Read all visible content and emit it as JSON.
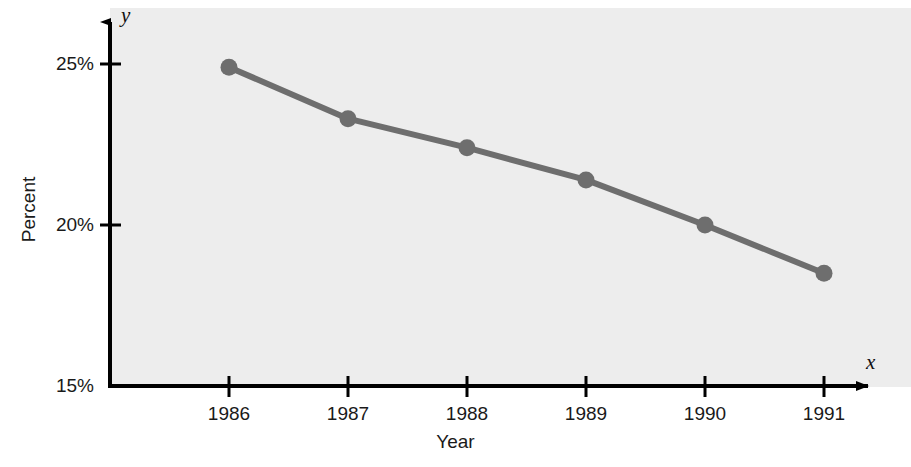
{
  "chart_data": {
    "type": "line",
    "title": "",
    "subtitle": "",
    "xlabel": "Year",
    "ylabel": "Percent",
    "x_axis_variable": "x",
    "y_axis_variable": "y",
    "categories": [
      "1986",
      "1987",
      "1988",
      "1989",
      "1990",
      "1991"
    ],
    "x": [
      1986,
      1987,
      1988,
      1989,
      1990,
      1991
    ],
    "values": [
      24.9,
      23.3,
      22.4,
      21.4,
      20.0,
      18.5
    ],
    "y_tick_labels": [
      "25%",
      "20%",
      "15%"
    ],
    "y_tick_values": [
      25,
      20,
      15
    ],
    "ylim": [
      15,
      26.3
    ],
    "xlim": [
      1985.4,
      1991.5
    ],
    "grid": false,
    "legend": null,
    "legend_position": "none",
    "series": [
      {
        "name": "Percent",
        "values": [
          24.9,
          23.3,
          22.4,
          21.4,
          20.0,
          18.5
        ]
      }
    ],
    "annotations": [],
    "colors": {
      "line": "#6e6e6e",
      "marker": "#6e6e6e",
      "plot_background": "#ededed",
      "axis": "#000000",
      "text": "#1a1a1a",
      "figure_background": "#ffffff"
    }
  }
}
